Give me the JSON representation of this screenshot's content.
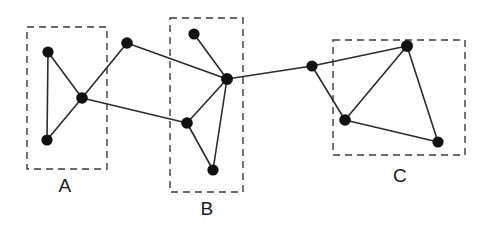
{
  "figure": {
    "width": 484,
    "height": 241,
    "background_color": "#ffffff",
    "node_color": "#111111",
    "edge_color": "#2b2b2b",
    "box_color": "#3a3a3a",
    "label_color": "#1a1a1a"
  },
  "chart_data": {
    "type": "scatter",
    "title": "",
    "xlabel": "",
    "ylabel": "",
    "grid": false,
    "legend": "none",
    "xlim": [
      0,
      484
    ],
    "ylim": [
      0,
      241
    ],
    "nodes": [
      {
        "id": "a1",
        "x": 48,
        "y": 52,
        "cluster": "A",
        "r": 5.6
      },
      {
        "id": "a2",
        "x": 82,
        "y": 98,
        "cluster": "A",
        "r": 5.8
      },
      {
        "id": "a3",
        "x": 47,
        "y": 140,
        "cluster": "A",
        "r": 5.6
      },
      {
        "id": "br1",
        "x": 127,
        "y": 43,
        "cluster": "bridge",
        "r": 5.8
      },
      {
        "id": "b1",
        "x": 194,
        "y": 34,
        "cluster": "B",
        "r": 5.6
      },
      {
        "id": "b2",
        "x": 227,
        "y": 79,
        "cluster": "B",
        "r": 6.0
      },
      {
        "id": "b3",
        "x": 187,
        "y": 123,
        "cluster": "B",
        "r": 5.8
      },
      {
        "id": "b4",
        "x": 213,
        "y": 170,
        "cluster": "B",
        "r": 5.6
      },
      {
        "id": "br2",
        "x": 312,
        "y": 66,
        "cluster": "bridge",
        "r": 5.6
      },
      {
        "id": "c1",
        "x": 407,
        "y": 46,
        "cluster": "C",
        "r": 6.0
      },
      {
        "id": "c2",
        "x": 345,
        "y": 120,
        "cluster": "C",
        "r": 5.8
      },
      {
        "id": "c3",
        "x": 438,
        "y": 142,
        "cluster": "C",
        "r": 5.6
      }
    ],
    "edges": [
      {
        "from": "a1",
        "to": "a3"
      },
      {
        "from": "a1",
        "to": "a2"
      },
      {
        "from": "a2",
        "to": "a3"
      },
      {
        "from": "a2",
        "to": "br1"
      },
      {
        "from": "a2",
        "to": "b3"
      },
      {
        "from": "br1",
        "to": "b2"
      },
      {
        "from": "b1",
        "to": "b2"
      },
      {
        "from": "b2",
        "to": "b3"
      },
      {
        "from": "b2",
        "to": "b4"
      },
      {
        "from": "b3",
        "to": "b4"
      },
      {
        "from": "b2",
        "to": "br2"
      },
      {
        "from": "br2",
        "to": "c1"
      },
      {
        "from": "br2",
        "to": "c2"
      },
      {
        "from": "c1",
        "to": "c2"
      },
      {
        "from": "c1",
        "to": "c3"
      },
      {
        "from": "c2",
        "to": "c3"
      }
    ],
    "clusters": [
      {
        "id": "A",
        "label": "A",
        "x": 27,
        "y": 27,
        "width": 80,
        "height": 142,
        "label_x": 65,
        "label_y": 192
      },
      {
        "id": "B",
        "label": "B",
        "x": 170,
        "y": 18,
        "width": 73,
        "height": 174,
        "label_x": 207,
        "label_y": 215
      },
      {
        "id": "C",
        "label": "C",
        "x": 333,
        "y": 40,
        "width": 132,
        "height": 115,
        "label_x": 400,
        "label_y": 182
      }
    ]
  }
}
